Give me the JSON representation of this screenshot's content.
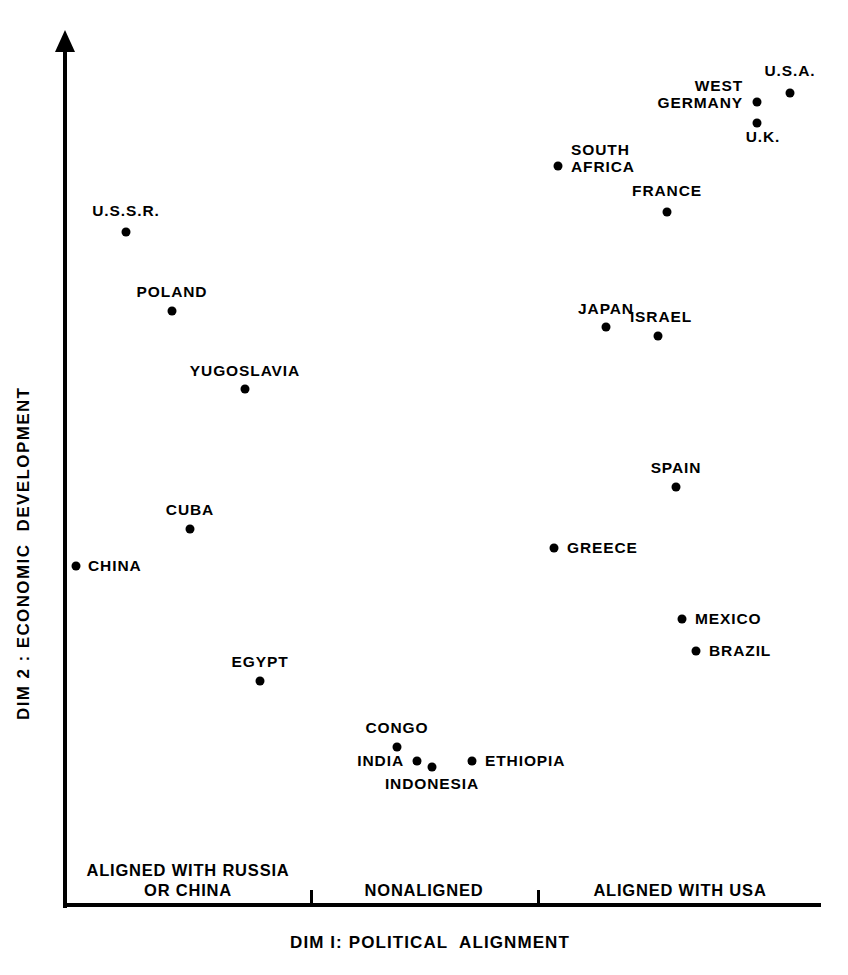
{
  "chart_data": {
    "type": "scatter",
    "title": "",
    "xlabel": "DIM I: POLITICAL  ALIGNMENT",
    "ylabel": "DIM 2 : ECONOMIC  DEVELOPMENT",
    "xlim": [
      0,
      1
    ],
    "ylim": [
      0,
      1
    ],
    "grid": false,
    "legend": null,
    "x_category_ticks": [
      {
        "label": "ALIGNED WITH RUSSIA\nOR CHINA",
        "x_px": 188,
        "center_x": 0.17
      },
      {
        "label": "NONALIGNED",
        "x_px": 424,
        "center_x": 0.475
      },
      {
        "label": "ALIGNED WITH USA",
        "x_px": 680,
        "center_x": 0.81
      }
    ],
    "x_tick_marks_px": [
      310,
      537
    ],
    "points": [
      {
        "name": "U.S.A.",
        "x": 0.962,
        "y": 0.947,
        "x_px": 790,
        "y_px": 93,
        "label_x": 790,
        "label_y": 62,
        "label_align": "c"
      },
      {
        "name": "WEST\nGERMANY",
        "x": 0.918,
        "y": 0.936,
        "x_px": 757,
        "y_px": 102,
        "label_x": 743,
        "label_y": 77,
        "label_align": "r"
      },
      {
        "name": "U.K.",
        "x": 0.918,
        "y": 0.912,
        "x_px": 757,
        "y_px": 123,
        "label_x": 763,
        "label_y": 128,
        "label_align": "c"
      },
      {
        "name": "SOUTH\nAFRICA",
        "x": 0.654,
        "y": 0.862,
        "x_px": 558,
        "y_px": 166,
        "label_x": 571,
        "label_y": 141,
        "label_align": "l"
      },
      {
        "name": "FRANCE",
        "x": 0.798,
        "y": 0.808,
        "x_px": 667,
        "y_px": 212,
        "label_x": 667,
        "label_y": 182,
        "label_align": "c"
      },
      {
        "name": "U.S.S.R.",
        "x": 0.082,
        "y": 0.793,
        "x_px": 126,
        "y_px": 232,
        "label_x": 126,
        "label_y": 202,
        "label_align": "c"
      },
      {
        "name": "POLAND",
        "x": 0.15,
        "y": 0.7,
        "x_px": 172,
        "y_px": 311,
        "label_x": 172,
        "label_y": 283,
        "label_align": "c"
      },
      {
        "name": "YUGOSLAVIA",
        "x": 0.253,
        "y": 0.633,
        "x_px": 245,
        "y_px": 389,
        "label_x": 245,
        "label_y": 362,
        "label_align": "c"
      },
      {
        "name": "JAPAN",
        "x": 0.714,
        "y": 0.677,
        "x_px": 606,
        "y_px": 327,
        "label_x": 606,
        "label_y": 300,
        "label_align": "c"
      },
      {
        "name": "ISRAEL",
        "x": 0.785,
        "y": 0.669,
        "x_px": 658,
        "y_px": 336,
        "label_x": 661,
        "label_y": 308,
        "label_align": "c"
      },
      {
        "name": "SPAIN",
        "x": 0.806,
        "y": 0.553,
        "x_px": 676,
        "y_px": 487,
        "label_x": 676,
        "label_y": 459,
        "label_align": "c"
      },
      {
        "name": "CUBA",
        "x": 0.173,
        "y": 0.531,
        "x_px": 190,
        "y_px": 529,
        "label_x": 190,
        "label_y": 501,
        "label_align": "c"
      },
      {
        "name": "CHINA",
        "x": 0.015,
        "y": 0.484,
        "x_px": 76,
        "y_px": 566,
        "label_x": 88,
        "label_y": 557,
        "label_align": "l"
      },
      {
        "name": "GREECE",
        "x": 0.644,
        "y": 0.506,
        "x_px": 554,
        "y_px": 548,
        "label_x": 567,
        "label_y": 539,
        "label_align": "l"
      },
      {
        "name": "MEXICO",
        "x": 0.814,
        "y": 0.429,
        "x_px": 682,
        "y_px": 619,
        "label_x": 695,
        "label_y": 610,
        "label_align": "l"
      },
      {
        "name": "BRAZIL",
        "x": 0.832,
        "y": 0.401,
        "x_px": 696,
        "y_px": 651,
        "label_x": 709,
        "label_y": 642,
        "label_align": "l"
      },
      {
        "name": "EGYPT",
        "x": 0.263,
        "y": 0.376,
        "x_px": 260,
        "y_px": 681,
        "label_x": 260,
        "label_y": 653,
        "label_align": "c"
      },
      {
        "name": "CONGO",
        "x": 0.441,
        "y": 0.315,
        "x_px": 397,
        "y_px": 747,
        "label_x": 397,
        "label_y": 719,
        "label_align": "c"
      },
      {
        "name": "INDIA",
        "x": 0.467,
        "y": 0.303,
        "x_px": 417,
        "y_px": 761,
        "label_x": 404,
        "label_y": 752,
        "label_align": "r"
      },
      {
        "name": "INDONESIA",
        "x": 0.487,
        "y": 0.297,
        "x_px": 432,
        "y_px": 767,
        "label_x": 432,
        "label_y": 775,
        "label_align": "c"
      },
      {
        "name": "ETHIOPIA",
        "x": 0.539,
        "y": 0.303,
        "x_px": 472,
        "y_px": 761,
        "label_x": 485,
        "label_y": 752,
        "label_align": "l"
      }
    ]
  }
}
